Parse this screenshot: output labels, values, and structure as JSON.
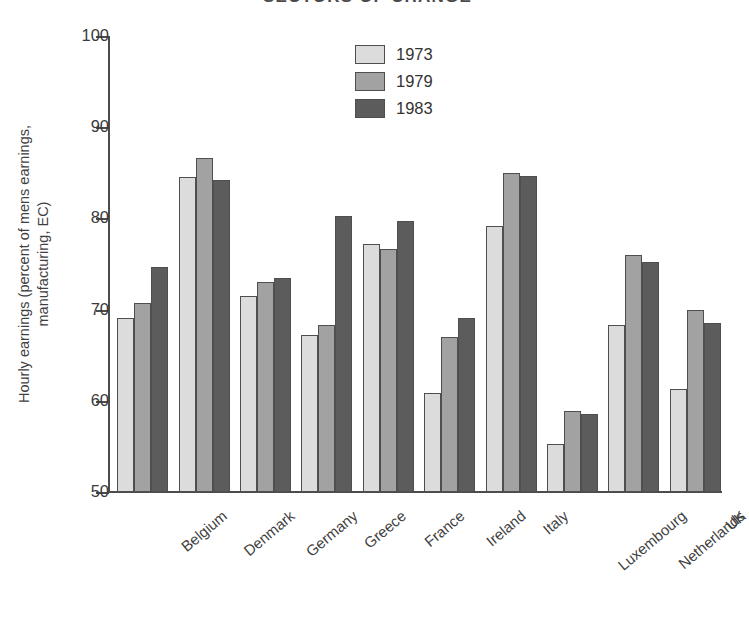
{
  "chart_data": {
    "type": "bar",
    "title": "SECTORS OF CHANGE",
    "xlabel": "",
    "ylabel_line1": "Hourly earnings (percent of mens earnings,",
    "ylabel_line2": "manufacturing, EC)",
    "ylim": [
      50,
      100
    ],
    "yticks": [
      100,
      90,
      80,
      70,
      60,
      50
    ],
    "grid": false,
    "legend_position": "top-center",
    "categories": [
      "Belgium",
      "Denmark",
      "Germany",
      "Greece",
      "France",
      "Ireland",
      "Italy",
      "Luxembourg",
      "Netherlands",
      "UK"
    ],
    "series": [
      {
        "name": "1973",
        "color": "#dcdcdc",
        "values": [
          69.1,
          84.5,
          71.5,
          67.2,
          77.2,
          60.9,
          79.2,
          55.3,
          68.3,
          61.3
        ]
      },
      {
        "name": "1979",
        "color": "#a2a2a2",
        "values": [
          70.7,
          86.6,
          73.0,
          68.3,
          76.6,
          67.0,
          85.0,
          58.9,
          76.0,
          70.0
        ]
      },
      {
        "name": "1983",
        "color": "#5c5c5c",
        "values": [
          74.7,
          84.2,
          73.5,
          80.3,
          79.7,
          69.1,
          84.6,
          58.6,
          75.2,
          68.5
        ]
      }
    ]
  },
  "axis": {
    "tick_labels": [
      "100",
      "90",
      "80",
      "70",
      "60",
      "50"
    ]
  },
  "legend": {
    "items": [
      {
        "label": "1973",
        "color": "#dcdcdc"
      },
      {
        "label": "1979",
        "color": "#a2a2a2"
      },
      {
        "label": "1983",
        "color": "#5c5c5c"
      }
    ]
  }
}
